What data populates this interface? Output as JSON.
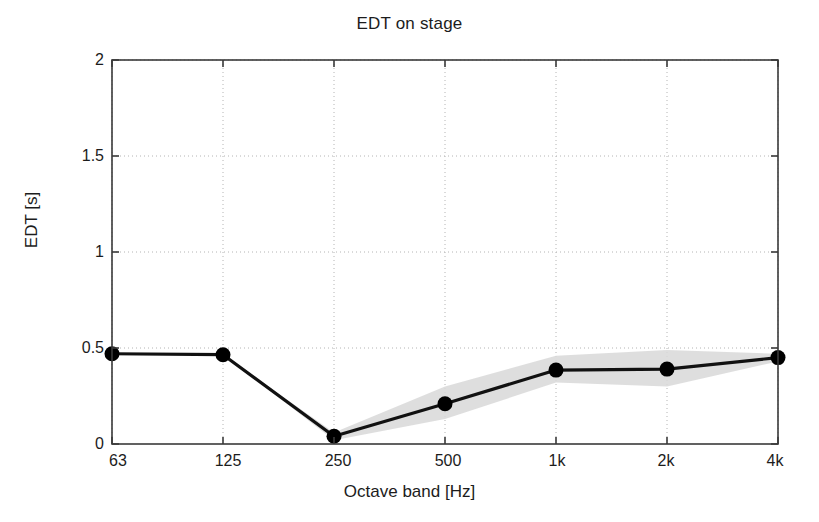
{
  "chart_data": {
    "type": "line",
    "title": "EDT on stage",
    "xlabel": "Octave band [Hz]",
    "ylabel": "EDT [s]",
    "categories": [
      "63",
      "125",
      "250",
      "500",
      "1k",
      "2k",
      "4k"
    ],
    "values": [
      0.47,
      0.465,
      0.04,
      0.21,
      0.385,
      0.39,
      0.45
    ],
    "series": [
      {
        "name": "EDT mean",
        "values": [
          0.47,
          0.465,
          0.04,
          0.21,
          0.385,
          0.39,
          0.45
        ]
      },
      {
        "name": "spread-upper",
        "values": [
          0.47,
          0.465,
          0.06,
          0.3,
          0.46,
          0.49,
          0.47
        ]
      },
      {
        "name": "spread-lower",
        "values": [
          0.47,
          0.465,
          0.02,
          0.13,
          0.32,
          0.3,
          0.43
        ]
      }
    ],
    "yticks": [
      0,
      0.5,
      1,
      1.5,
      2
    ],
    "ytick_labels": [
      "0",
      "0.5",
      "1",
      "1.5",
      "2"
    ],
    "ylim": [
      0,
      2
    ],
    "xlim": [
      0,
      6
    ],
    "grid": true,
    "legend": "none",
    "marker": "filled-circle",
    "colors": {
      "line": "#111111",
      "marker": "#000000",
      "band": "#d8d8d8",
      "grid": "#b4b4b4",
      "axis": "#3a3a3a",
      "background": "#ffffff"
    }
  }
}
